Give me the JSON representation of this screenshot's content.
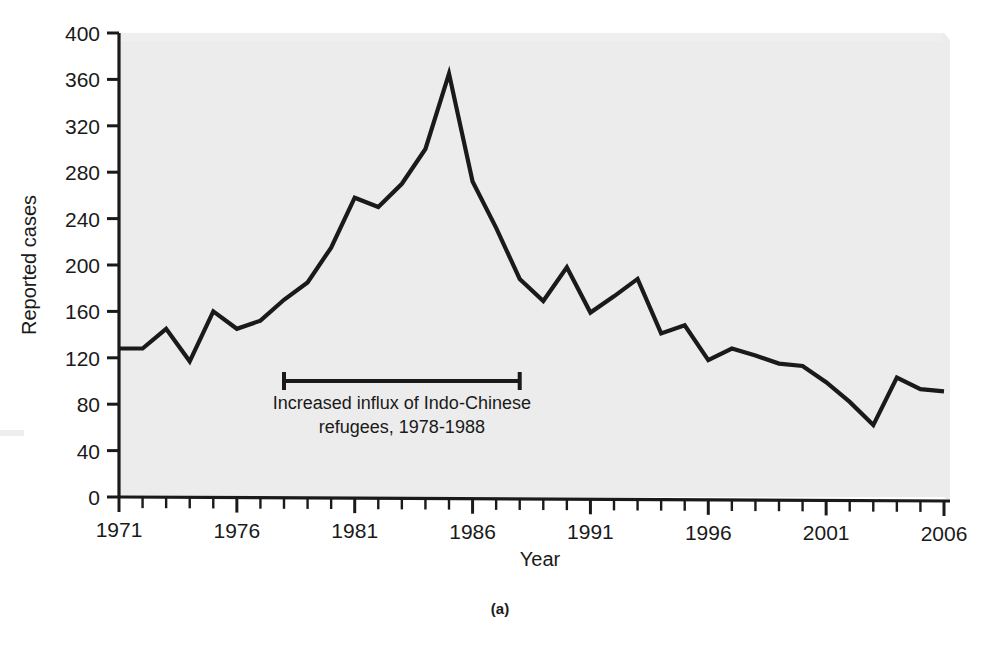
{
  "figure": {
    "panel_label": "(a)",
    "background_color": "#ffffff",
    "plot_background_color": "#e3e3e3",
    "line_color": "#1a1a1a",
    "axis_color": "#1a1a1a"
  },
  "annotation": {
    "line1": "Increased influx of Indo-Chinese",
    "line2": "refugees, 1978-1988",
    "bracket_start_year": 1978,
    "bracket_end_year": 1988,
    "bracket_value": 100
  },
  "chart_data": {
    "type": "line",
    "title": "",
    "xlabel": "Year",
    "ylabel": "Reported cases",
    "xlim": [
      1971,
      2006
    ],
    "ylim": [
      0,
      400
    ],
    "grid": false,
    "legend": "none",
    "ytick_labels": [
      "0",
      "40",
      "80",
      "120",
      "160",
      "200",
      "240",
      "280",
      "320",
      "360",
      "400"
    ],
    "ytick_values": [
      0,
      40,
      80,
      120,
      160,
      200,
      240,
      280,
      320,
      360,
      400
    ],
    "xtick_labels": [
      "1971",
      "1976",
      "1981",
      "1986",
      "1991",
      "1996",
      "2001",
      "2006"
    ],
    "xtick_values": [
      1971,
      1976,
      1981,
      1986,
      1991,
      1996,
      2001,
      2006
    ],
    "xminor_step": 1,
    "x": [
      1971,
      1972,
      1973,
      1974,
      1975,
      1976,
      1977,
      1978,
      1979,
      1980,
      1981,
      1982,
      1983,
      1984,
      1985,
      1986,
      1987,
      1988,
      1989,
      1990,
      1991,
      1992,
      1993,
      1994,
      1995,
      1996,
      1997,
      1998,
      1999,
      2000,
      2001,
      2002,
      2003,
      2004,
      2005,
      2006
    ],
    "values": [
      128,
      128,
      145,
      117,
      160,
      145,
      152,
      170,
      185,
      215,
      258,
      250,
      270,
      300,
      365,
      272,
      232,
      188,
      169,
      198,
      159,
      173,
      188,
      141,
      148,
      118,
      128,
      122,
      115,
      113,
      99,
      82,
      62,
      103,
      93,
      91
    ],
    "series": [
      {
        "name": "Reported cases",
        "values": [
          128,
          128,
          145,
          117,
          160,
          145,
          152,
          170,
          185,
          215,
          258,
          250,
          270,
          300,
          365,
          272,
          232,
          188,
          169,
          198,
          159,
          173,
          188,
          141,
          148,
          118,
          128,
          122,
          115,
          113,
          99,
          82,
          62,
          103,
          93,
          91
        ]
      }
    ]
  }
}
